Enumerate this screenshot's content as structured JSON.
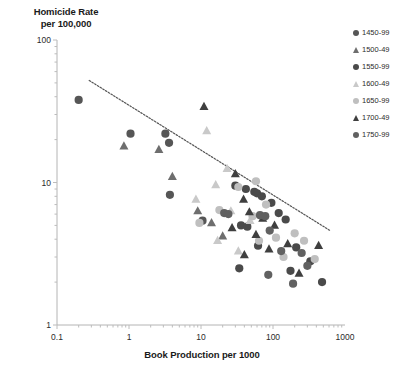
{
  "chart_data": {
    "type": "scatter",
    "title": "",
    "ylabel": "Homicide Rate\nper 100,000",
    "xlabel": "Book Production per 1000",
    "xscale": "log",
    "yscale": "log",
    "xlim": [
      0.1,
      1000
    ],
    "ylim": [
      1,
      100
    ],
    "xticks": [
      "0.1",
      "1",
      "10",
      "100",
      "1000"
    ],
    "yticks": [
      "1",
      "10",
      "100"
    ],
    "grid": false,
    "legend_position": "right",
    "trendline": {
      "label": "",
      "style": "dotted",
      "x0": 0.28,
      "y0": 52,
      "x1": 620,
      "y1": 4.6,
      "color": "#555555"
    },
    "series": [
      {
        "name": "1450-99",
        "marker": "circle",
        "color": "#565656",
        "points": [
          {
            "x": 0.2,
            "y": 38
          },
          {
            "x": 1.05,
            "y": 22
          },
          {
            "x": 3.2,
            "y": 22
          },
          {
            "x": 3.6,
            "y": 19
          },
          {
            "x": 3.7,
            "y": 8.2
          },
          {
            "x": 10.5,
            "y": 5.4
          }
        ]
      },
      {
        "name": "1500-49",
        "marker": "triangle",
        "color": "#6e6e6e",
        "points": [
          {
            "x": 0.85,
            "y": 18
          },
          {
            "x": 2.6,
            "y": 17
          },
          {
            "x": 4.0,
            "y": 11
          },
          {
            "x": 9.0,
            "y": 6.3
          },
          {
            "x": 14,
            "y": 5.2
          },
          {
            "x": 20,
            "y": 4.2
          }
        ]
      },
      {
        "name": "1550-99",
        "marker": "circle",
        "color": "#4a4a4a",
        "points": [
          {
            "x": 30,
            "y": 9.5
          },
          {
            "x": 42,
            "y": 9.0
          },
          {
            "x": 55,
            "y": 8.6
          },
          {
            "x": 60,
            "y": 8.4
          },
          {
            "x": 70,
            "y": 8.0
          },
          {
            "x": 95,
            "y": 7.2
          },
          {
            "x": 120,
            "y": 6.1
          },
          {
            "x": 36,
            "y": 5.0
          },
          {
            "x": 44,
            "y": 4.9
          },
          {
            "x": 150,
            "y": 5.5
          },
          {
            "x": 62,
            "y": 3.6
          },
          {
            "x": 210,
            "y": 3.5
          },
          {
            "x": 330,
            "y": 2.8
          },
          {
            "x": 175,
            "y": 2.4
          },
          {
            "x": 480,
            "y": 2.0
          },
          {
            "x": 34,
            "y": 2.5
          }
        ]
      },
      {
        "name": "1600-49",
        "marker": "triangle",
        "color": "#c9c9c9",
        "points": [
          {
            "x": 12,
            "y": 23
          },
          {
            "x": 23,
            "y": 12.5
          },
          {
            "x": 16,
            "y": 9.6
          },
          {
            "x": 8.5,
            "y": 7.6
          },
          {
            "x": 26,
            "y": 6.3
          },
          {
            "x": 48,
            "y": 5.4
          },
          {
            "x": 17,
            "y": 3.9
          },
          {
            "x": 33,
            "y": 3.3
          }
        ]
      },
      {
        "name": "1650-99",
        "marker": "circle",
        "color": "#bfbfbf",
        "points": [
          {
            "x": 9.5,
            "y": 5.2
          },
          {
            "x": 18,
            "y": 6.4
          },
          {
            "x": 33,
            "y": 9.3
          },
          {
            "x": 58,
            "y": 10.2
          },
          {
            "x": 80,
            "y": 7.0
          },
          {
            "x": 52,
            "y": 5.8
          },
          {
            "x": 110,
            "y": 4.1
          },
          {
            "x": 64,
            "y": 3.9
          },
          {
            "x": 200,
            "y": 4.4
          },
          {
            "x": 270,
            "y": 3.9
          },
          {
            "x": 140,
            "y": 3.0
          },
          {
            "x": 380,
            "y": 2.9
          }
        ]
      },
      {
        "name": "1700-49",
        "marker": "triangle",
        "color": "#3f3f3f",
        "points": [
          {
            "x": 11,
            "y": 34
          },
          {
            "x": 30,
            "y": 11.5
          },
          {
            "x": 39,
            "y": 7.6
          },
          {
            "x": 47,
            "y": 6.2
          },
          {
            "x": 72,
            "y": 5.6
          },
          {
            "x": 105,
            "y": 5.0
          },
          {
            "x": 27,
            "y": 4.8
          },
          {
            "x": 58,
            "y": 4.3
          },
          {
            "x": 88,
            "y": 3.4
          },
          {
            "x": 160,
            "y": 3.7
          },
          {
            "x": 430,
            "y": 3.6
          },
          {
            "x": 40,
            "y": 3.1
          },
          {
            "x": 230,
            "y": 2.3
          }
        ]
      },
      {
        "name": "1750-99",
        "marker": "circle",
        "color": "#616161",
        "points": [
          {
            "x": 21,
            "y": 6.1
          },
          {
            "x": 24,
            "y": 6.0
          },
          {
            "x": 66,
            "y": 5.9
          },
          {
            "x": 78,
            "y": 5.8
          },
          {
            "x": 90,
            "y": 4.6
          },
          {
            "x": 130,
            "y": 3.3
          },
          {
            "x": 250,
            "y": 3.2
          },
          {
            "x": 300,
            "y": 2.6
          },
          {
            "x": 190,
            "y": 1.95
          },
          {
            "x": 86,
            "y": 2.25
          }
        ]
      }
    ]
  },
  "axes": {
    "y_title": "Homicide Rate\nper 100,000",
    "x_title": "Book Production per 1000"
  },
  "legend": {
    "items": [
      {
        "label": "1450-99",
        "marker": "circle",
        "color": "#565656"
      },
      {
        "label": "1500-49",
        "marker": "triangle",
        "color": "#6e6e6e"
      },
      {
        "label": "1550-99",
        "marker": "circle",
        "color": "#4a4a4a"
      },
      {
        "label": "1600-49",
        "marker": "triangle",
        "color": "#c9c9c9"
      },
      {
        "label": "1650-99",
        "marker": "circle",
        "color": "#bfbfbf"
      },
      {
        "label": "1700-49",
        "marker": "triangle",
        "color": "#3f3f3f"
      },
      {
        "label": "1750-99",
        "marker": "circle",
        "color": "#616161"
      }
    ]
  }
}
